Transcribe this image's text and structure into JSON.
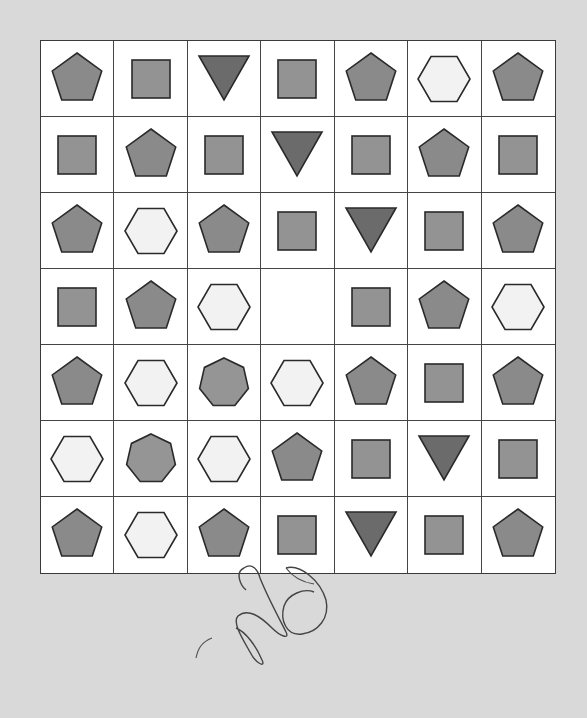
{
  "puzzle": {
    "rows": 7,
    "cols": 7,
    "colors": {
      "pentagon": "#8a8a8a",
      "square": "#939393",
      "triangle": "#6b6b6b",
      "hexagon": "#f2f2f2",
      "heptagon": "#959595",
      "stroke": "#2a2a2a",
      "grid_line": "#444444",
      "background": "#d9d9d9"
    },
    "grid": [
      [
        "pentagon",
        "square",
        "triangle",
        "square",
        "pentagon",
        "hexagon",
        "pentagon"
      ],
      [
        "square",
        "pentagon",
        "square",
        "triangle",
        "square",
        "pentagon",
        "square"
      ],
      [
        "pentagon",
        "hexagon",
        "pentagon",
        "square",
        "triangle",
        "square",
        "pentagon"
      ],
      [
        "square",
        "pentagon",
        "hexagon",
        "empty",
        "square",
        "pentagon",
        "hexagon"
      ],
      [
        "pentagon",
        "hexagon",
        "heptagon",
        "hexagon",
        "pentagon",
        "square",
        "pentagon"
      ],
      [
        "hexagon",
        "heptagon",
        "hexagon",
        "pentagon",
        "square",
        "triangle",
        "square"
      ],
      [
        "pentagon",
        "hexagon",
        "pentagon",
        "square",
        "triangle",
        "square",
        "pentagon"
      ]
    ],
    "missing_cell": {
      "row": 4,
      "col": 4
    }
  },
  "annotation": {
    "type": "handwritten-scribble",
    "color": "#444444"
  }
}
